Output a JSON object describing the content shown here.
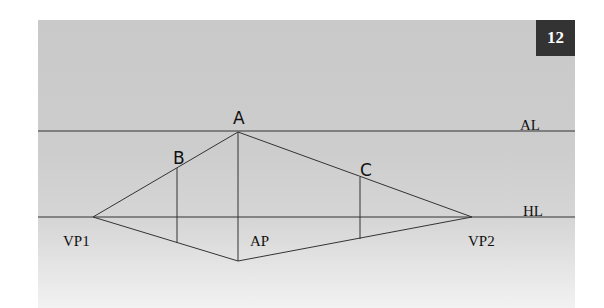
{
  "figure": {
    "number": "12",
    "labels": {
      "A": "A",
      "B": "B",
      "C": "C",
      "AL": "AL",
      "HL": "HL",
      "VP1": "VP1",
      "VP2": "VP2",
      "AP": "AP"
    },
    "colors": {
      "line": "#333333",
      "badge": "#333333",
      "background_top": "#c9c9c9",
      "background_bottom": "#f2f2f2"
    }
  }
}
